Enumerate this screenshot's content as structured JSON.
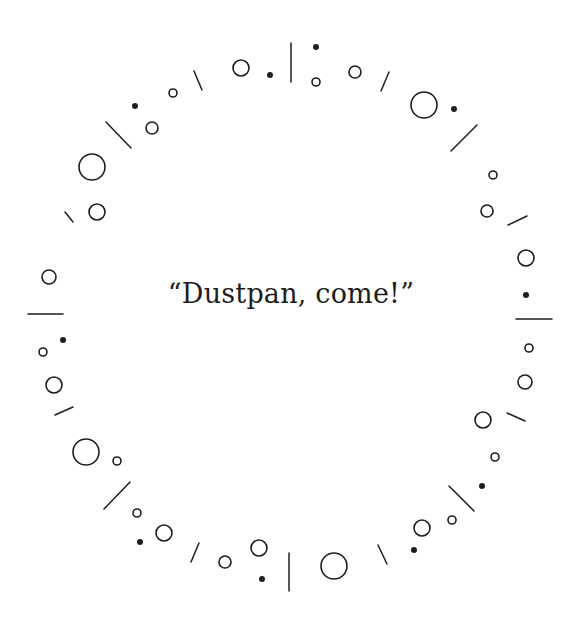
{
  "quote": {
    "text": "“Dustpan, come!”"
  },
  "colors": {
    "ink": "#1e1e1e",
    "background": "#ffffff"
  },
  "ring": {
    "circles": [
      [
        97,
        212,
        8
      ],
      [
        92,
        167,
        13
      ],
      [
        152,
        128,
        6
      ],
      [
        173,
        93,
        4
      ],
      [
        241,
        68,
        8
      ],
      [
        316,
        82,
        4
      ],
      [
        355,
        72,
        6
      ],
      [
        424,
        105,
        13
      ],
      [
        493,
        175,
        4
      ],
      [
        487,
        211,
        6
      ],
      [
        49,
        277,
        7
      ],
      [
        43,
        352,
        4
      ],
      [
        54,
        385,
        8
      ],
      [
        526,
        258,
        8
      ],
      [
        529,
        348,
        4
      ],
      [
        525,
        382,
        7
      ],
      [
        483,
        420,
        8
      ],
      [
        86,
        452,
        13
      ],
      [
        117,
        461,
        4
      ],
      [
        137,
        513,
        4
      ],
      [
        164,
        533,
        8
      ],
      [
        225,
        562,
        6
      ],
      [
        259,
        548,
        8
      ],
      [
        334,
        566,
        13
      ],
      [
        422,
        528,
        8
      ],
      [
        452,
        520,
        4
      ],
      [
        495,
        457,
        4
      ]
    ],
    "dots": [
      [
        135,
        106
      ],
      [
        270,
        75
      ],
      [
        316,
        47
      ],
      [
        454,
        109
      ],
      [
        63,
        340
      ],
      [
        526,
        295
      ],
      [
        140,
        542
      ],
      [
        262,
        579
      ],
      [
        414,
        550
      ],
      [
        482,
        486
      ]
    ],
    "lines": [
      [
        65,
        212,
        73,
        222
      ],
      [
        106,
        122,
        131,
        148
      ],
      [
        194,
        71,
        202,
        90
      ],
      [
        291,
        43,
        291,
        82
      ],
      [
        381,
        91,
        389,
        72
      ],
      [
        451,
        151,
        477,
        125
      ],
      [
        508,
        225,
        527,
        216
      ],
      [
        28,
        314,
        63,
        314
      ],
      [
        55,
        415,
        73,
        407
      ],
      [
        516,
        319,
        552,
        319
      ],
      [
        507,
        413,
        525,
        421
      ],
      [
        104,
        509,
        130,
        482
      ],
      [
        191,
        562,
        199,
        543
      ],
      [
        289,
        553,
        289,
        591
      ],
      [
        378,
        545,
        387,
        564
      ],
      [
        449,
        486,
        474,
        511
      ]
    ]
  }
}
